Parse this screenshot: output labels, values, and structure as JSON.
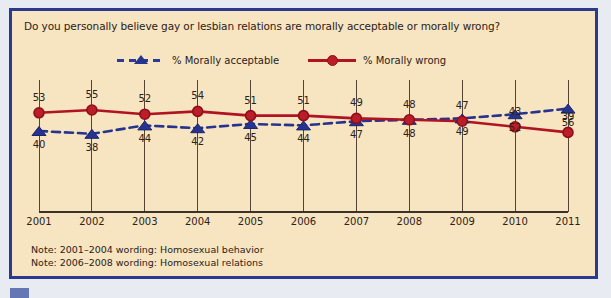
{
  "chart_data": {
    "type": "line",
    "title": "Do you personally believe gay or lesbian relations are morally acceptable or morally wrong?",
    "xlabel": "",
    "ylabel": "",
    "categories": [
      "2001",
      "2002",
      "2003",
      "2004",
      "2005",
      "2006",
      "2007",
      "2008",
      "2009",
      "2010",
      "2011"
    ],
    "x": [
      2001,
      2002,
      2003,
      2004,
      2005,
      2006,
      2007,
      2008,
      2009,
      2010,
      2011
    ],
    "ylim": [
      30,
      60
    ],
    "grid": "vertical",
    "legend_position": "top",
    "series": [
      {
        "name": "% Morally acceptable",
        "color": "#27348f",
        "style": "dashed",
        "marker": "triangle",
        "label_position": "below",
        "values": [
          40,
          38,
          44,
          42,
          45,
          44,
          47,
          48,
          49,
          52,
          56
        ]
      },
      {
        "name": "% Morally wrong",
        "color": "#b01322",
        "style": "solid",
        "marker": "circle",
        "label_position": "above",
        "values": [
          53,
          55,
          52,
          54,
          51,
          51,
          49,
          48,
          47,
          43,
          39
        ]
      }
    ],
    "notes": [
      "Note: 2001–2004 wording: Homosexual behavior",
      "Note: 2006–2008 wording: Homosexual relations"
    ]
  },
  "colors": {
    "page_background": "#e9ebf2",
    "panel_background": "#f7e4c0",
    "frame_border": "#2a3a8e",
    "acceptable": "#27348f",
    "wrong": "#b01322",
    "axis": "#554433",
    "text": "#2b2218",
    "corner_tag": "#6675b4"
  }
}
